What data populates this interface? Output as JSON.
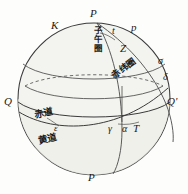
{
  "figure": {
    "kind": "celestial-sphere-diagram",
    "title_visible": false,
    "background_color": "#fdfdfc",
    "line_color": "#3a3a3a",
    "shade_color": "#f2f2ee"
  },
  "labels": {
    "pole_north": "P",
    "pole_south": "P",
    "ecliptic_pole": "K",
    "hour_angle": "t",
    "hour_circle": "p",
    "zenith_star": "Z",
    "sigma": "σ",
    "declination": "δ",
    "left_point": "Q",
    "right_point": "Q'",
    "vernal_equinox": "γ",
    "right_ascension": "α",
    "point_t": "T",
    "obliquity": "ε"
  },
  "chinese_labels": {
    "meridian_circle": "子午圈",
    "declination_circle": "赤纬圈",
    "celestial_equator": "赤道",
    "ecliptic": "黄道"
  }
}
